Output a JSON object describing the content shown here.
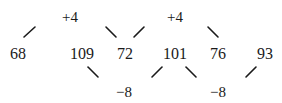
{
  "diagram": {
    "sequence": [
      "68",
      "109",
      "72",
      "101",
      "76",
      "93"
    ],
    "differences_top": [
      "+4",
      "+4"
    ],
    "differences_bottom": [
      "−8",
      "−8"
    ]
  }
}
